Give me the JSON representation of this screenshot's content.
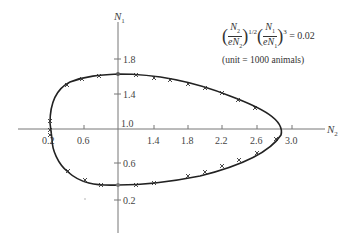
{
  "diagram": {
    "type": "phase-plane trajectory",
    "axes": {
      "horizontal": {
        "label": "N",
        "subscript": "2",
        "ticks": [
          "0.2",
          "0.6",
          "1.4",
          "1.8",
          "2.2",
          "2.6",
          "3.0"
        ]
      },
      "vertical": {
        "label": "N",
        "subscript": "1",
        "ticks": [
          "1.8",
          "1.4",
          "1.0",
          "0.6",
          "0.2"
        ]
      }
    },
    "equation": {
      "text": "(N2/eN̄2)^(1/2) (N1/eN̄1)^3 = 0.02",
      "rhs": "= 0.02",
      "exp1": "1/2",
      "exp2": "3"
    },
    "unit_note": "(unit = 1000 animals)",
    "curve": {
      "description": "closed orbit around equilibrium (1.0, 1.0)",
      "approx_points_N2_N1": [
        [
          0.2,
          1.0
        ],
        [
          0.25,
          1.3
        ],
        [
          0.45,
          1.48
        ],
        [
          0.7,
          1.55
        ],
        [
          1.0,
          1.57
        ],
        [
          1.5,
          1.54
        ],
        [
          2.0,
          1.45
        ],
        [
          2.5,
          1.25
        ],
        [
          2.85,
          1.0
        ],
        [
          2.6,
          0.8
        ],
        [
          2.0,
          0.65
        ],
        [
          1.5,
          0.58
        ],
        [
          1.0,
          0.56
        ],
        [
          0.6,
          0.6
        ],
        [
          0.4,
          0.7
        ],
        [
          0.25,
          0.85
        ]
      ]
    },
    "colors": {
      "curve": "#222222",
      "axis": "#777777",
      "text": "#444444"
    }
  }
}
